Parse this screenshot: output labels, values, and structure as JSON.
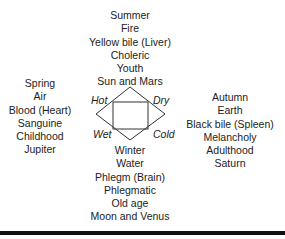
{
  "top": [
    "Summer",
    "Fire",
    "Yellow bile (Liver)",
    "Choleric",
    "Youth",
    "Sun and Mars"
  ],
  "left": [
    "Spring",
    "Air",
    "Blood (Heart)",
    "Sanguine",
    "Childhood",
    "Jupiter"
  ],
  "right": [
    "Autumn",
    "Earth",
    "Black bile (Spleen)",
    "Melancholy",
    "Adulthood",
    "Saturn"
  ],
  "bottom": [
    "Winter",
    "Water",
    "Phlegm (Brain)",
    "Phlegmatic",
    "Old age",
    "Moon and Venus"
  ],
  "qualities": {
    "hot": "Hot",
    "dry": "Dry",
    "wet": "Wet",
    "cold": "Cold"
  }
}
